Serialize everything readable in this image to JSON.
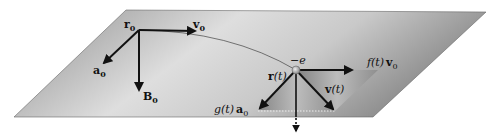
{
  "figure": {
    "colors": {
      "plane_light": "#d9d9d9",
      "plane_dark": "#8f8f8f",
      "arrow": "#111111",
      "electron": "#b8b8b8"
    },
    "labels": {
      "r0": {
        "main": "r",
        "sub": "0"
      },
      "v0": {
        "main": "v",
        "sub": "0"
      },
      "a0": {
        "main": "a",
        "sub": "0"
      },
      "B0": {
        "main": "B",
        "sub": "0"
      },
      "electron": "−e",
      "r_t": {
        "main": "r",
        "arg": "(t)"
      },
      "v_t": {
        "main": "v",
        "arg": "(t)"
      },
      "f_t_v0": {
        "func": "f",
        "arg": "(t)",
        "vec": "v",
        "sub": "0"
      },
      "g_t_a0": {
        "func": "g",
        "arg": "(t)",
        "vec": "a",
        "sub": "0"
      }
    }
  }
}
